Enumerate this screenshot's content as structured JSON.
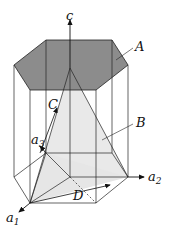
{
  "figure": {
    "colors": {
      "plane_A_fill": "#8c8c8c",
      "plane_B_fill": "#e6e6e6",
      "lines": "#222222"
    },
    "labels": {
      "c_axis": "c",
      "plane_A": "A",
      "plane_B": "B",
      "direction_C": "C",
      "direction_D": "D",
      "axis_a1": "a",
      "axis_a1_sub": "1",
      "axis_a2": "a",
      "axis_a2_sub": "2",
      "axis_a3": "a",
      "axis_a3_sub": "3"
    }
  }
}
